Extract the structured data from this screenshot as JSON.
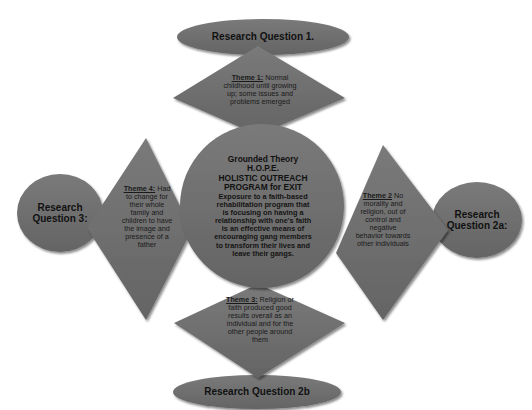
{
  "diagram": {
    "colors": {
      "shape_fill": "#6e6e6e",
      "shape_shadow": "#3a3a3a",
      "shape_highlight": "#9a9a9a",
      "text": "#111111",
      "background": "#ffffff"
    },
    "center": {
      "shape": "circle",
      "title_lines": [
        "Grounded Theory",
        "H.O.P.E.",
        "HOLISTIC OUTREACH",
        "PROGRAM for EXIT"
      ],
      "body": "Exposure to a faith-based rehabilitation program that is focusing on having a relationship with one's faith is an effective means of encouraging gang members to transform their lives and leave their gangs."
    },
    "research_questions": [
      {
        "id": "rq1",
        "label": "Research Question 1.",
        "position": "top",
        "shape": "ellipse"
      },
      {
        "id": "rq2a",
        "label": "Research Question 2a:",
        "position": "right",
        "shape": "ellipse"
      },
      {
        "id": "rq2b",
        "label": "Research Question 2b",
        "position": "bottom",
        "shape": "ellipse"
      },
      {
        "id": "rq3",
        "label": "Research Question 3:",
        "position": "left",
        "shape": "ellipse"
      }
    ],
    "themes": [
      {
        "id": "theme1",
        "heading": "Theme 1:",
        "text": "Normal childhood until growing up; some issues and problems emerged",
        "position": "top",
        "shape": "diamond"
      },
      {
        "id": "theme2",
        "heading": "Theme 2",
        "text": "No morality and religion, out of control and negative behavior towards other individuals",
        "position": "right",
        "shape": "diamond"
      },
      {
        "id": "theme3",
        "heading": "Theme 3:",
        "text": "Religion or faith produced good results overall as an individual and for the other people around them",
        "position": "bottom",
        "shape": "diamond"
      },
      {
        "id": "theme4",
        "heading": "Theme 4:",
        "text": "Had to change for their whole family and children to have the image and presence of a father",
        "position": "left",
        "shape": "diamond"
      }
    ]
  }
}
